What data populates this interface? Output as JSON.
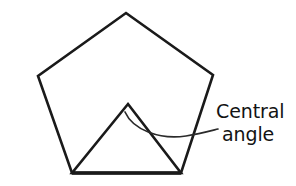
{
  "figure": {
    "background_color": "#ffffff",
    "stroke_color": "#1a1a1a",
    "arc_color": "#2b2b2b",
    "text_color": "#131313",
    "title": "",
    "pentagon": {
      "name": "regular-pentagon",
      "vertices": [
        {
          "label": "top",
          "x": 126,
          "y": 13
        },
        {
          "label": "upper-right",
          "x": 213,
          "y": 75
        },
        {
          "label": "lower-right",
          "x": 181,
          "y": 173
        },
        {
          "label": "lower-left",
          "x": 72,
          "y": 173
        },
        {
          "label": "upper-left",
          "x": 38,
          "y": 76
        }
      ],
      "points_attr": "126,13 213,75 181,173 72,173 38,76"
    },
    "inner_triangle": {
      "name": "central-triangle",
      "vertices": [
        {
          "label": "apex-center",
          "x": 128,
          "y": 104
        },
        {
          "label": "base-right",
          "x": 181,
          "y": 173
        },
        {
          "label": "base-left",
          "x": 72,
          "y": 173
        }
      ],
      "points_attr": "128,104 181,173 72,173"
    },
    "base_edge": {
      "name": "pentagon-base-edge",
      "path_attr": "M 72,173 L 181,173"
    },
    "angle_arc": {
      "name": "central-angle-arc",
      "path_attr": "M 125,112 C 133,130 160,140 186,136 C 199,134 210,131 218,129"
    },
    "callout": {
      "line_1": "Central",
      "line_2": "angle",
      "line_1_x": 216,
      "line_1_y": 118,
      "line_2_x": 222,
      "line_2_y": 141,
      "full_text": "Central angle"
    }
  }
}
